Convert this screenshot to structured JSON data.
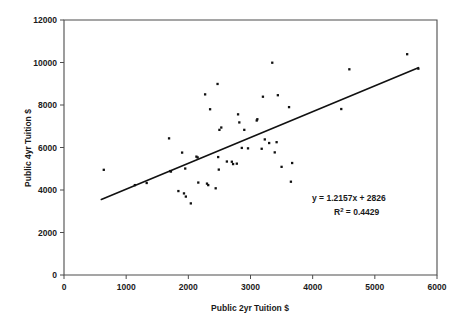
{
  "chart_data": {
    "type": "scatter",
    "title": "",
    "xlabel": "Public 2yr Tuition $",
    "ylabel": "Public 4yr Tuition $",
    "xlim": [
      0,
      6000
    ],
    "ylim": [
      0,
      12000
    ],
    "xticks": [
      0,
      1000,
      2000,
      3000,
      4000,
      5000,
      6000
    ],
    "yticks": [
      0,
      2000,
      4000,
      6000,
      8000,
      10000,
      12000
    ],
    "xtick_labels": [
      "0",
      "1000",
      "2000",
      "3000",
      "4000",
      "5000",
      "6000"
    ],
    "ytick_labels": [
      "0",
      "2000",
      "4000",
      "6000",
      "8000",
      "10000",
      "12000"
    ],
    "grid": false,
    "legend": false,
    "marker": "filled-square",
    "marker_color": "#111111",
    "series": [
      {
        "name": "Public tuition by state",
        "points": [
          [
            640,
            4950
          ],
          [
            1140,
            4230
          ],
          [
            1330,
            4330
          ],
          [
            1690,
            6430
          ],
          [
            1710,
            4890
          ],
          [
            1720,
            4870
          ],
          [
            1840,
            3950
          ],
          [
            1900,
            5760
          ],
          [
            1930,
            3840
          ],
          [
            1950,
            5010
          ],
          [
            1960,
            3690
          ],
          [
            2040,
            3370
          ],
          [
            2130,
            5570
          ],
          [
            2150,
            5530
          ],
          [
            2160,
            4350
          ],
          [
            2270,
            8500
          ],
          [
            2300,
            4300
          ],
          [
            2320,
            4230
          ],
          [
            2350,
            7800
          ],
          [
            2440,
            4080
          ],
          [
            2470,
            8990
          ],
          [
            2480,
            5550
          ],
          [
            2490,
            4960
          ],
          [
            2500,
            6830
          ],
          [
            2530,
            6940
          ],
          [
            2620,
            5340
          ],
          [
            2700,
            5330
          ],
          [
            2720,
            5220
          ],
          [
            2780,
            5240
          ],
          [
            2800,
            7560
          ],
          [
            2820,
            7180
          ],
          [
            2860,
            5980
          ],
          [
            2900,
            6830
          ],
          [
            2960,
            5960
          ],
          [
            3100,
            7270
          ],
          [
            3110,
            7330
          ],
          [
            3180,
            5940
          ],
          [
            3200,
            8390
          ],
          [
            3230,
            6380
          ],
          [
            3300,
            6210
          ],
          [
            3350,
            9990
          ],
          [
            3390,
            5770
          ],
          [
            3420,
            6250
          ],
          [
            3440,
            8460
          ],
          [
            3500,
            5090
          ],
          [
            3620,
            7900
          ],
          [
            3650,
            4390
          ],
          [
            3670,
            5270
          ],
          [
            4460,
            7810
          ],
          [
            4590,
            9680
          ],
          [
            5520,
            10390
          ],
          [
            5700,
            9710
          ]
        ]
      }
    ],
    "trendline": {
      "equation": "y = 1.2157x + 2826",
      "r_squared_label": "R",
      "r_squared_sup": "2",
      "r_squared_value": " = 0.4429",
      "slope": 1.2157,
      "intercept": 2826,
      "x_start": 600,
      "x_end": 5700,
      "color": "#111111"
    }
  }
}
